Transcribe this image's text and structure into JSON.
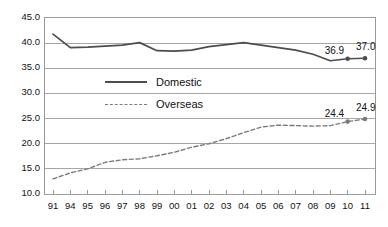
{
  "chart_data": {
    "type": "line",
    "title": "",
    "subtitle": "",
    "xlabel": "",
    "ylabel": "",
    "ylim": [
      10.0,
      45.0
    ],
    "ytick_step": 5.0,
    "ytick_labels": [
      "45.0",
      "40.0",
      "35.0",
      "30.0",
      "25.0",
      "20.0",
      "15.0",
      "10.0"
    ],
    "ytick_values": [
      45.0,
      40.0,
      35.0,
      30.0,
      25.0,
      20.0,
      15.0,
      10.0
    ],
    "grid": true,
    "grid_axis": "y",
    "legend_position": "inside-left-upper",
    "categories": [
      "91",
      "94",
      "95",
      "96",
      "97",
      "98",
      "99",
      "00",
      "01",
      "02",
      "03",
      "04",
      "05",
      "06",
      "07",
      "08",
      "09",
      "10",
      "11"
    ],
    "series": [
      {
        "name": "Domestic",
        "style": "solid",
        "color": "#4d4d4d",
        "values": [
          41.8,
          39.1,
          39.2,
          39.4,
          39.6,
          40.1,
          38.5,
          38.4,
          38.6,
          39.3,
          39.7,
          40.1,
          39.6,
          39.1,
          38.6,
          37.8,
          36.5,
          36.9,
          37.0
        ],
        "labeled_points": [
          {
            "category": "10",
            "value": 36.9,
            "label": "36.9"
          },
          {
            "category": "11",
            "value": 37.0,
            "label": "37.0"
          }
        ]
      },
      {
        "name": "Overseas",
        "style": "dashed",
        "color": "#7b7b7b",
        "values": [
          13.0,
          14.2,
          15.0,
          16.3,
          16.8,
          17.0,
          17.6,
          18.3,
          19.3,
          20.0,
          21.0,
          22.2,
          23.3,
          23.7,
          23.6,
          23.5,
          23.6,
          24.4,
          24.9
        ],
        "labeled_points": [
          {
            "category": "10",
            "value": 24.4,
            "label": "24.4"
          },
          {
            "category": "11",
            "value": 24.9,
            "label": "24.9"
          }
        ]
      }
    ]
  },
  "legend": {
    "items": [
      {
        "label": "Domestic",
        "style": "solid"
      },
      {
        "label": "Overseas",
        "style": "dashed"
      }
    ]
  },
  "annotations": {
    "domestic_last_but_one": "36.9",
    "domestic_last": "37.0",
    "overseas_last_but_one": "24.4",
    "overseas_last": "24.9"
  },
  "colors": {
    "domestic_line": "#4d4d4d",
    "overseas_line": "#7b7b7b",
    "grid": "#a6a6a6",
    "frame": "#9a9a9a",
    "text": "#111111",
    "background": "#ffffff"
  }
}
